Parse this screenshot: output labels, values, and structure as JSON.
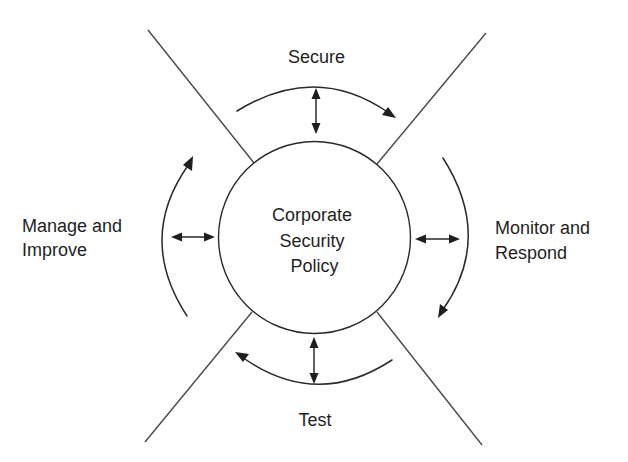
{
  "diagram": {
    "type": "cyclic process diagram",
    "center": {
      "lines": [
        "Corporate",
        "Security",
        "Policy"
      ]
    },
    "phases": [
      {
        "id": "secure",
        "position": "top",
        "lines": [
          "Secure"
        ]
      },
      {
        "id": "monitor",
        "position": "right",
        "lines": [
          "Monitor and",
          "Respond"
        ]
      },
      {
        "id": "test",
        "position": "bottom",
        "lines": [
          "Test"
        ]
      },
      {
        "id": "manage",
        "position": "left",
        "lines": [
          "Manage and",
          "Improve"
        ]
      }
    ],
    "cycle_direction": "clockwise",
    "colors": {
      "background": "#ffffff",
      "ink": "#1f1f1f",
      "separator": "#4a4a4a"
    }
  }
}
